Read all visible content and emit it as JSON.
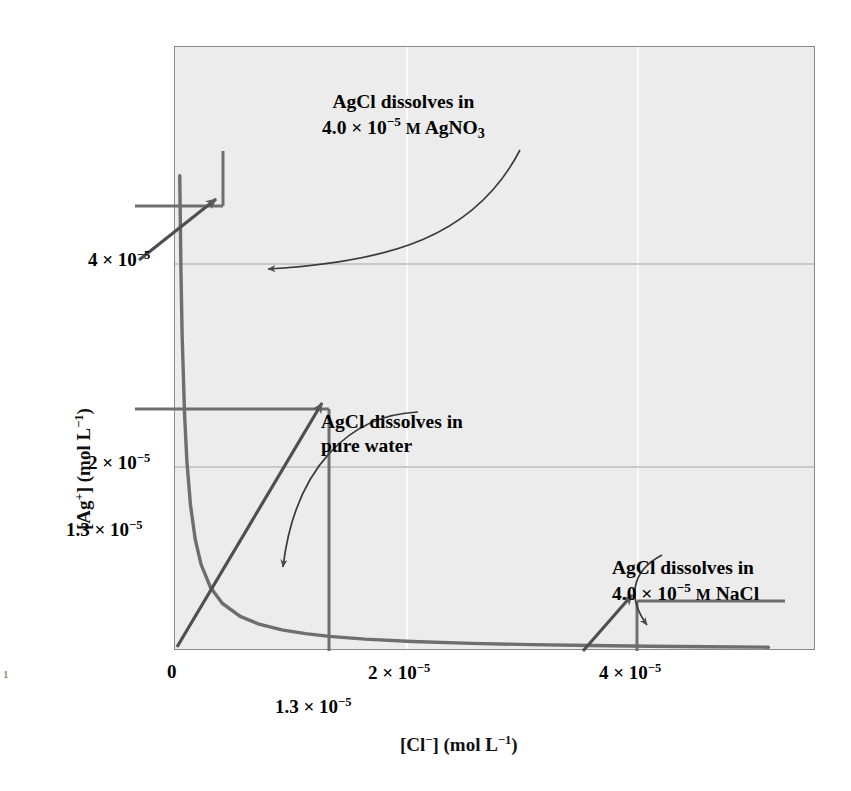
{
  "figure": {
    "page_marker": "1"
  },
  "axes": {
    "y_title_html": "[Ag<sup>+</sup>] (mol L<sup>−1</sup>)",
    "x_title_html": "[Cl<sup>−</sup>] (mol L<sup>−1</sup>)",
    "y_ticks": [
      {
        "label_html": "4 × 10<sup>−5</sup>",
        "value": 4e-05
      },
      {
        "label_html": "2 × 10<sup>−5</sup>",
        "value": 2e-05
      },
      {
        "label_html": "1.3 × 10<sup>−5</sup>",
        "value": 1.3e-05
      }
    ],
    "x_ticks": [
      {
        "label_html": "0",
        "value": 0
      },
      {
        "label_html": "2 × 10<sup>−5</sup>",
        "value": 2e-05
      },
      {
        "label_html": "4 × 10<sup>−5</sup>",
        "value": 4e-05
      }
    ],
    "x_extra_tick": {
      "label_html": "1.3 × 10<sup>−5</sup>",
      "value": 1.3e-05
    }
  },
  "annotations": [
    {
      "id": "agno3",
      "line1": "AgCl dissolves in",
      "line2_html": "4.0 × 10<sup>−5</sup> <span class=\"smcap\">M</span> AgNO<sub>3</sub>",
      "point": {
        "x": 4e-07,
        "y": 4.3e-05
      }
    },
    {
      "id": "pure-water",
      "line1": "AgCl dissolves in",
      "line2_html": "pure water",
      "point": {
        "x": 1.3e-05,
        "y": 1.3e-05
      }
    },
    {
      "id": "nacl",
      "line1": "AgCl dissolves in",
      "line2_html": "4.0 × 10<sup>−5</sup> <span class=\"smcap\">M</span> NaCl",
      "point": {
        "x": 4e-05,
        "y": 4.2e-06
      }
    }
  ],
  "bleed_text": [
    "4.0 grams Cl(aq)",
    "of 0.1 solubility Curve for the AgCl in the A",
    "Ag  Cl  =  K",
    "0.010     +     x",
    "solution of so a 0.1 M solution of 0.10 moles of",
    "0.0125      1.0 × 10    =  1.8 ×",
    "solved terms is equilibrium. Determination of their concentration",
    "of 0.010 M the silver milligrams of solid AgCl present in a",
    "from the volume of the solution saturated with solute",
    "HCl(aq)  →  H  +  Cl",
    "is equal to",
    "4.0 × 10 moles per liter",
    "the molarity of the chloride ion concentration"
  ],
  "chart_data": {
    "type": "line",
    "title": "",
    "xlabel": "[Cl−] (mol L−1)",
    "ylabel": "[Ag+] (mol L−1)",
    "xlim": [
      0,
      5.4e-05
    ],
    "ylim": [
      0,
      5.4e-05
    ],
    "grid": true,
    "legend": "none",
    "relationship": "Ksp hyperbola: [Ag+][Cl-] = 1.7e-10",
    "ksp": 1.7e-10,
    "series": [
      {
        "name": "AgCl solubility curve",
        "color": "#6e6e6e",
        "x": [
          4e-07,
          5e-07,
          6e-07,
          8e-07,
          1e-06,
          1.3e-06,
          1.7e-06,
          2.2e-06,
          3e-06,
          4e-06,
          5.5e-06,
          7e-06,
          9e-06,
          1.1e-05,
          1.3e-05,
          1.6e-05,
          2e-05,
          2.5e-05,
          3e-05,
          3.5e-05,
          4e-05,
          4.5e-05,
          5e-05
        ],
        "y": [
          4.25e-05,
          3.4e-05,
          2.83e-05,
          2.13e-05,
          1.7e-05,
          1.31e-05,
          1e-05,
          7.73e-06,
          5.67e-06,
          4.25e-06,
          3.09e-06,
          2.43e-06,
          1.89e-06,
          1.55e-06,
          1.31e-06,
          1.06e-06,
          8.5e-07,
          6.8e-07,
          5.67e-07,
          4.86e-07,
          4.25e-07,
          3.78e-07,
          3.4e-07
        ]
      }
    ],
    "marked_points": [
      {
        "label": "AgCl dissolves in 4.0 × 10−5 M AgNO3",
        "x": 4e-07,
        "y": 4.3e-05
      },
      {
        "label": "AgCl dissolves in pure water",
        "x": 1.3e-05,
        "y": 1.3e-05
      },
      {
        "label": "AgCl dissolves in 4.0 × 10−5 M NaCl",
        "x": 4e-05,
        "y": 4.2e-06
      }
    ]
  }
}
